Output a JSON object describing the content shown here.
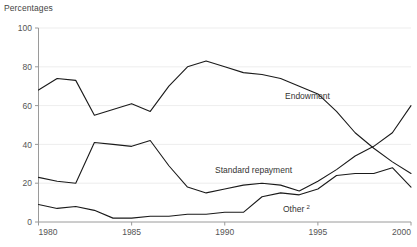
{
  "chart_data": {
    "type": "line",
    "title": "",
    "subtitle": "",
    "unit_label": "Percentages",
    "xlabel": "",
    "ylabel": "",
    "xlim": [
      1980,
      2000
    ],
    "ylim": [
      0,
      100
    ],
    "grid": true,
    "legend_position": "inline-annotations",
    "x_ticks": [
      1980,
      1985,
      1990,
      1995,
      2000
    ],
    "x_tick_labels": [
      "1980",
      "1985",
      "1990",
      "1995",
      "2000"
    ],
    "y_ticks": [
      0,
      20,
      40,
      60,
      80,
      100
    ],
    "y_tick_labels": [
      "0",
      "20",
      "40",
      "60",
      "80",
      "100"
    ],
    "x": [
      1980,
      1981,
      1982,
      1983,
      1984,
      1985,
      1986,
      1987,
      1988,
      1989,
      1990,
      1991,
      1992,
      1993,
      1994,
      1995,
      1996,
      1997,
      1998,
      1999,
      2000
    ],
    "series": [
      {
        "name": "Endowment",
        "label": "Endowment",
        "color": "#1a1a1a",
        "values": [
          68,
          74,
          73,
          55,
          58,
          61,
          57,
          70,
          80,
          83,
          80,
          77,
          76,
          74,
          70,
          66,
          57,
          46,
          38,
          31,
          25
        ]
      },
      {
        "name": "Standard repayment",
        "label": "Standard repayment",
        "color": "#1a1a1a",
        "values": [
          23,
          21,
          20,
          41,
          40,
          39,
          42,
          29,
          18,
          15,
          17,
          19,
          20,
          19,
          16,
          21,
          27,
          34,
          39,
          46,
          60
        ]
      },
      {
        "name": "Other",
        "label": "Other",
        "label_superscript": "2",
        "color": "#1a1a1a",
        "values": [
          9,
          7,
          8,
          6,
          2,
          2,
          3,
          3,
          4,
          4,
          5,
          5,
          13,
          15,
          14,
          17,
          24,
          25,
          25,
          28,
          18
        ]
      }
    ],
    "annotations": [
      {
        "text": "Endowment",
        "x_px": 285,
        "y_px": 99
      },
      {
        "text": "Standard repayment",
        "x_px": 215,
        "y_px": 173
      },
      {
        "text": "Other",
        "superscript": "2",
        "x_px": 283,
        "y_px": 212
      }
    ]
  }
}
